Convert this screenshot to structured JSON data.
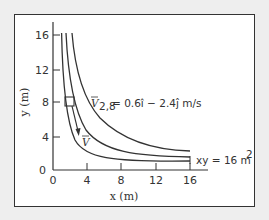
{
  "figure": {
    "x_axis": {
      "label": "x (m)",
      "ticks": [
        "0",
        "4",
        "8",
        "12",
        "16"
      ]
    },
    "y_axis": {
      "label": "y (m)",
      "ticks": [
        "0",
        "4",
        "8",
        "12",
        "16"
      ]
    },
    "velocity_annotation": {
      "symbol": "V",
      "subscript": "2,8",
      "expression": "= 0.6î − 2.4ĵ m/s"
    },
    "velocity_vector_label": "V",
    "curve_label": "xy = 16 m",
    "curve_label_sup": "2",
    "curves": [
      {
        "name": "streamline-xy16",
        "c": 16
      },
      {
        "name": "streamline-xy24",
        "c": 24
      },
      {
        "name": "streamline-xy36",
        "c": 36
      }
    ],
    "marked_point": {
      "x": 2,
      "y": 8
    },
    "colors": {
      "line": "#333333",
      "background": "#ffffff",
      "page": "#eeeeee"
    }
  }
}
